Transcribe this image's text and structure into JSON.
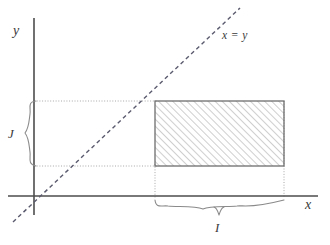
{
  "figure": {
    "kind": "math-diagram",
    "background_color": "#ffffff",
    "axes": {
      "y_axis_label": "y",
      "x_axis_label": "x",
      "origin": {
        "x": 34,
        "y": 196
      },
      "x_axis": {
        "x1": 8,
        "y1": 196,
        "x2": 318,
        "y2": 196
      },
      "y_axis": {
        "x1": 34,
        "y1": 18,
        "x2": 34,
        "y2": 215
      },
      "axis_color": "#4d4d4d"
    },
    "diagonal": {
      "label": "x = y",
      "style": "dashed",
      "color": "#5a5a6e",
      "x1": 13,
      "y1": 222,
      "x2": 240,
      "y2": 8
    },
    "rectangle": {
      "fill_style": "diagonal-hatch",
      "hatch_angle_degrees": 45,
      "hatch_color": "#8e8e8e",
      "outline_color": "#6e6e6e",
      "left": 155,
      "top": 101,
      "right": 284,
      "bottom": 166
    },
    "guides": {
      "color": "#a8a8a8",
      "style": "dotted",
      "horizontal": [
        {
          "x1": 34,
          "y1": 101,
          "x2": 155,
          "y2": 101
        },
        {
          "x1": 34,
          "y1": 166,
          "x2": 155,
          "y2": 166
        }
      ],
      "vertical": [
        {
          "x1": 155,
          "y1": 166,
          "x2": 155,
          "y2": 196
        },
        {
          "x1": 284,
          "y1": 101,
          "x2": 284,
          "y2": 196
        }
      ]
    },
    "braces": {
      "vertical_brace": {
        "label": "J",
        "meaning": "interval-on-y-axis",
        "from_y": 101,
        "to_y": 166,
        "x": 30,
        "opens": "right"
      },
      "horizontal_brace": {
        "label": "I",
        "meaning": "interval-on-x-axis",
        "from_x": 155,
        "to_x": 284,
        "y": 202,
        "opens": "up"
      }
    }
  }
}
